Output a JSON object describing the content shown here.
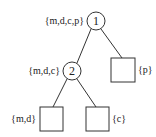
{
  "diagram": {
    "type": "tree",
    "nodes": [
      {
        "id": "1",
        "shape": "circle",
        "label": "1",
        "set": "{m,d,c,p}"
      },
      {
        "id": "2",
        "shape": "circle",
        "label": "2",
        "set": "{m,d,c}"
      },
      {
        "id": "leaf-p",
        "shape": "square",
        "label": "",
        "set": "{p}"
      },
      {
        "id": "leaf-md",
        "shape": "square",
        "label": "",
        "set": "{m,d}"
      },
      {
        "id": "leaf-c",
        "shape": "square",
        "label": "",
        "set": "{c}"
      }
    ],
    "edges": [
      {
        "from": "1",
        "to": "2"
      },
      {
        "from": "1",
        "to": "leaf-p"
      },
      {
        "from": "2",
        "to": "leaf-md"
      },
      {
        "from": "2",
        "to": "leaf-c"
      }
    ],
    "line_color": "#333333"
  }
}
